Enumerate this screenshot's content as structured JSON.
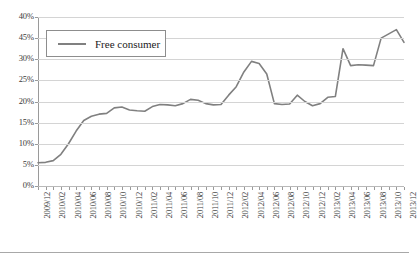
{
  "chart_data": {
    "type": "line",
    "title": "",
    "xlabel": "",
    "ylabel": "",
    "ylim": [
      0,
      40
    ],
    "yunit": "%",
    "grid": true,
    "legend_position": "top-left",
    "y_ticks": [
      "40%",
      "45%",
      "30%",
      "25%",
      "20%",
      "15%",
      "10%",
      "5%",
      "0%"
    ],
    "y_tick_values": [
      40,
      35,
      30,
      25,
      20,
      15,
      10,
      5,
      0
    ],
    "x_tick_labels": [
      "2009/12",
      "2010/02",
      "2010/04",
      "2010/06",
      "2010/08",
      "2010/10",
      "2010/12",
      "2011/02",
      "2011/04",
      "2011/06",
      "2011/08",
      "2011/10",
      "2011/12",
      "2012/02",
      "2012/04",
      "2012/06",
      "2012/08",
      "2012/10",
      "2012/12",
      "2013/02",
      "2013/04",
      "2013/06",
      "2013/08",
      "2013/10",
      "2013/12"
    ],
    "x": [
      "2009/12",
      "2010/01",
      "2010/02",
      "2010/03",
      "2010/04",
      "2010/05",
      "2010/06",
      "2010/07",
      "2010/08",
      "2010/09",
      "2010/10",
      "2010/11",
      "2010/12",
      "2011/01",
      "2011/02",
      "2011/03",
      "2011/04",
      "2011/05",
      "2011/06",
      "2011/07",
      "2011/08",
      "2011/09",
      "2011/10",
      "2011/11",
      "2011/12",
      "2012/01",
      "2012/02",
      "2012/03",
      "2012/04",
      "2012/05",
      "2012/06",
      "2012/07",
      "2012/08",
      "2012/09",
      "2012/10",
      "2012/11",
      "2012/12",
      "2013/01",
      "2013/02",
      "2013/03",
      "2013/04",
      "2013/05",
      "2013/06",
      "2013/07",
      "2013/08",
      "2013/09",
      "2013/10",
      "2013/11",
      "2013/12"
    ],
    "series": [
      {
        "name": "Free consumer",
        "color": "#808080",
        "values": [
          5.5,
          5.6,
          6.0,
          7.5,
          10.0,
          13.0,
          15.5,
          16.5,
          17.0,
          17.2,
          18.5,
          18.7,
          18.0,
          17.8,
          17.7,
          18.8,
          19.3,
          19.2,
          19.0,
          19.5,
          20.5,
          20.3,
          19.5,
          19.2,
          19.3,
          21.5,
          23.5,
          27.0,
          29.5,
          29.0,
          26.5,
          19.5,
          19.3,
          19.4,
          21.5,
          20.0,
          19.0,
          19.5,
          21.0,
          21.2,
          32.5,
          28.5,
          28.7,
          28.6,
          28.5,
          35.0,
          36.0,
          37.0,
          34.0
        ]
      }
    ]
  },
  "legend": {
    "label": "Free consumer"
  }
}
